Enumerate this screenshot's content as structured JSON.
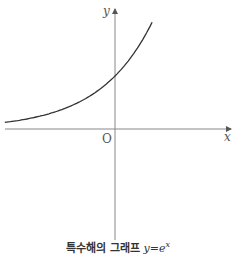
{
  "caption": {
    "text": "특수해의 그래프",
    "equation_lhs": "y",
    "equation_eq": "=",
    "equation_base": "e",
    "equation_exp": "x"
  },
  "axes": {
    "x_label": "x",
    "y_label": "y",
    "origin_label": "O"
  },
  "colors": {
    "curve": "#333333",
    "axis": "#777777",
    "text": "#555555"
  },
  "chart_data": {
    "type": "line",
    "xlabel": "x",
    "ylabel": "y",
    "function": "y = e^x",
    "x": [
      -2.08,
      -1.5,
      -1.0,
      -0.5,
      0,
      0.3,
      0.5,
      0.7
    ],
    "series": [
      {
        "name": "y=e^x",
        "values": [
          0.125,
          0.223,
          0.368,
          0.607,
          1.0,
          1.35,
          1.65,
          2.01
        ]
      }
    ],
    "xlim": [
      -2.08,
      2.2
    ],
    "ylim": [
      -2.1,
      2.3
    ],
    "grid": false,
    "ticks": "none (only origin O marked)"
  }
}
